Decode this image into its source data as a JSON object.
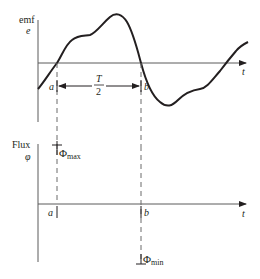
{
  "colors": {
    "ink": "#231f20",
    "axis": "#5a5a5a",
    "dashed": "#6a6a6a",
    "background": "#ffffff"
  },
  "top_graph": {
    "y_label_line1": "emf",
    "y_label_line2": "e",
    "x_label": "t",
    "point_a": "a",
    "point_b": "b",
    "interval_numerator": "T",
    "interval_denominator": "2"
  },
  "bottom_graph": {
    "y_label_line1": "Flux",
    "y_label_line2": "φ",
    "x_label": "t",
    "point_a": "a",
    "point_b": "b",
    "max_symbol": "Φ",
    "max_subscript": "max",
    "min_symbol": "Φ",
    "min_subscript": "min"
  }
}
